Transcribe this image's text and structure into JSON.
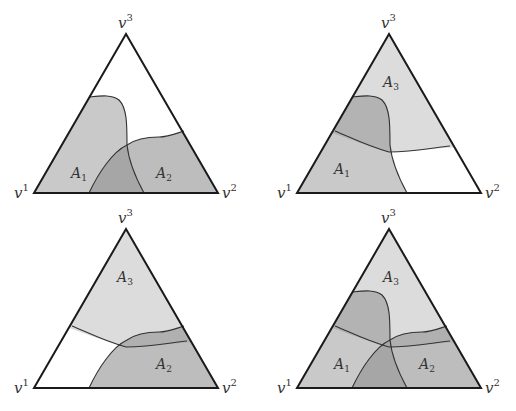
{
  "figure": {
    "colors": {
      "background": "#ffffff",
      "A1": "#c9c9c9",
      "A2": "#bdbdbd",
      "A3": "#dcdcdc",
      "overlap": "#a6a6a6",
      "overlap_A1A3": "#b3b3b3",
      "overlap_A2A3": "#b0b0b0",
      "edge": "#1a1a1a"
    },
    "vertex_labels": {
      "v1": {
        "base": "v",
        "sup": "1"
      },
      "v2": {
        "base": "v",
        "sup": "2"
      },
      "v3": {
        "base": "v",
        "sup": "3"
      }
    },
    "panels": [
      {
        "id": "top-left",
        "regions": [
          "A1",
          "A2"
        ],
        "labels": [
          {
            "base": "A",
            "sub": "1"
          },
          {
            "base": "A",
            "sub": "2"
          }
        ]
      },
      {
        "id": "top-right",
        "regions": [
          "A1",
          "A3"
        ],
        "labels": [
          {
            "base": "A",
            "sub": "3"
          },
          {
            "base": "A",
            "sub": "1"
          }
        ]
      },
      {
        "id": "bottom-left",
        "regions": [
          "A2",
          "A3"
        ],
        "labels": [
          {
            "base": "A",
            "sub": "3"
          },
          {
            "base": "A",
            "sub": "2"
          }
        ]
      },
      {
        "id": "bottom-right",
        "regions": [
          "A1",
          "A2",
          "A3"
        ],
        "labels": [
          {
            "base": "A",
            "sub": "3"
          },
          {
            "base": "A",
            "sub": "1"
          },
          {
            "base": "A",
            "sub": "2"
          }
        ]
      }
    ]
  }
}
